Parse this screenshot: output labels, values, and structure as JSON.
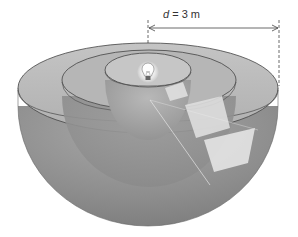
{
  "figure": {
    "dimension": {
      "variable": "d",
      "equals": " = 3 m",
      "value": 3,
      "unit": "m"
    },
    "shells": [
      {
        "name": "inner",
        "relative_radius": 1
      },
      {
        "name": "middle",
        "relative_radius": 2
      },
      {
        "name": "outer",
        "relative_radius": 3
      }
    ],
    "source": "light-bulb-icon",
    "colors": {
      "shell_outer": "#8a8a8a",
      "shell_rim": "#bdbdbd",
      "patch": "#e4e4e4",
      "line": "#333333"
    }
  }
}
